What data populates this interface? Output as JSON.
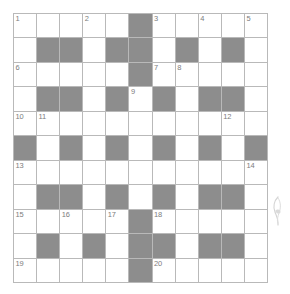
{
  "puzzle": {
    "title": "Crossword Grid",
    "type": "crossword",
    "rows": 11,
    "cols": 11,
    "colors": {
      "block": "#8d8d8d",
      "open": "#ffffff",
      "grid_line": "#b9b9b9",
      "number_text": "#7d7d7d",
      "page_background": "#ffffff",
      "decoration": "#b0b0b0"
    },
    "max_clue_number": 20,
    "grid": [
      [
        "open",
        "open",
        "open",
        "open",
        "open",
        "block",
        "open",
        "open",
        "open",
        "open",
        "open"
      ],
      [
        "open",
        "block",
        "block",
        "open",
        "block",
        "block",
        "open",
        "block",
        "open",
        "block",
        "open"
      ],
      [
        "open",
        "open",
        "open",
        "open",
        "open",
        "block",
        "open",
        "open",
        "open",
        "open",
        "open"
      ],
      [
        "open",
        "block",
        "block",
        "open",
        "block",
        "open",
        "block",
        "open",
        "block",
        "block",
        "open"
      ],
      [
        "open",
        "open",
        "open",
        "open",
        "open",
        "open",
        "open",
        "open",
        "open",
        "open",
        "open"
      ],
      [
        "block",
        "open",
        "block",
        "open",
        "block",
        "open",
        "block",
        "open",
        "block",
        "open",
        "block"
      ],
      [
        "open",
        "open",
        "open",
        "open",
        "open",
        "open",
        "open",
        "open",
        "open",
        "open",
        "open"
      ],
      [
        "open",
        "block",
        "block",
        "open",
        "block",
        "open",
        "block",
        "open",
        "block",
        "block",
        "open"
      ],
      [
        "open",
        "open",
        "open",
        "open",
        "open",
        "block",
        "open",
        "open",
        "open",
        "open",
        "open"
      ],
      [
        "open",
        "block",
        "open",
        "block",
        "open",
        "block",
        "block",
        "open",
        "block",
        "block",
        "open"
      ],
      [
        "open",
        "open",
        "open",
        "open",
        "open",
        "block",
        "open",
        "open",
        "open",
        "open",
        "open"
      ]
    ],
    "numbers": [
      {
        "row": 0,
        "col": 0,
        "number": "1"
      },
      {
        "row": 0,
        "col": 3,
        "number": "2"
      },
      {
        "row": 0,
        "col": 6,
        "number": "3"
      },
      {
        "row": 0,
        "col": 8,
        "number": "4"
      },
      {
        "row": 0,
        "col": 10,
        "number": "5"
      },
      {
        "row": 2,
        "col": 0,
        "number": "6"
      },
      {
        "row": 2,
        "col": 6,
        "number": "7"
      },
      {
        "row": 2,
        "col": 7,
        "number": "8"
      },
      {
        "row": 3,
        "col": 5,
        "number": "9"
      },
      {
        "row": 4,
        "col": 0,
        "number": "10"
      },
      {
        "row": 4,
        "col": 1,
        "number": "11"
      },
      {
        "row": 4,
        "col": 9,
        "number": "12"
      },
      {
        "row": 6,
        "col": 0,
        "number": "13"
      },
      {
        "row": 6,
        "col": 10,
        "number": "14"
      },
      {
        "row": 8,
        "col": 0,
        "number": "15"
      },
      {
        "row": 8,
        "col": 2,
        "number": "16"
      },
      {
        "row": 8,
        "col": 4,
        "number": "17"
      },
      {
        "row": 8,
        "col": 6,
        "number": "18"
      },
      {
        "row": 10,
        "col": 0,
        "number": "19"
      },
      {
        "row": 10,
        "col": 6,
        "number": "20"
      }
    ],
    "letters": []
  },
  "decoration": {
    "name": "feather-mark",
    "visible": true
  }
}
